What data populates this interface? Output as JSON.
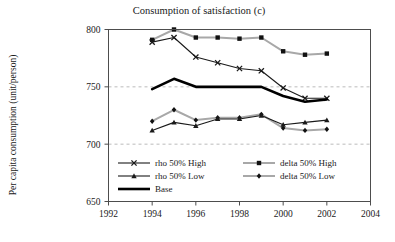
{
  "chart_data": {
    "type": "line",
    "title": "Consumption of satisfaction (c)",
    "xlabel": "",
    "ylabel": "Per capita consumption (unit/person)",
    "xlim": [
      1992,
      2004
    ],
    "ylim": [
      650,
      800
    ],
    "xticks": [
      1992,
      1994,
      1996,
      1998,
      2000,
      2002,
      2004
    ],
    "yticks": [
      650,
      700,
      750,
      800
    ],
    "grid": "horizontal-dashed",
    "legend_position": "inside-bottom-left",
    "x": [
      1994,
      1995,
      1996,
      1997,
      1998,
      1999,
      2000,
      2001,
      2002
    ],
    "series": [
      {
        "name": "rho 50% High",
        "values": [
          789,
          793,
          776,
          771,
          766,
          764,
          749,
          740,
          740
        ],
        "color": "#1a1a1a",
        "marker": "x",
        "width": 1.1
      },
      {
        "name": "rho 50% Low",
        "values": [
          712,
          719,
          716,
          722,
          722,
          725,
          717,
          719,
          721
        ],
        "color": "#1a1a1a",
        "marker": "triangle",
        "width": 1.1
      },
      {
        "name": "Base",
        "values": [
          748,
          757,
          750,
          750,
          750,
          750,
          742,
          737,
          739
        ],
        "color": "#000000",
        "marker": "none",
        "width": 2.6
      },
      {
        "name": "delta 50% High",
        "values": [
          791,
          800,
          793,
          793,
          792,
          793,
          781,
          778,
          779
        ],
        "color": "#a8a8a8",
        "marker": "square",
        "width": 2.0
      },
      {
        "name": "delta 50% Low",
        "values": [
          720,
          730,
          721,
          723,
          723,
          726,
          714,
          712,
          713
        ],
        "color": "#a8a8a8",
        "marker": "diamond",
        "width": 2.0
      }
    ],
    "legend": [
      {
        "label": "rho 50% High",
        "column": 0,
        "row": 0
      },
      {
        "label": "rho 50% Low",
        "column": 0,
        "row": 1
      },
      {
        "label": "Base",
        "column": 0,
        "row": 2
      },
      {
        "label": "delta 50% High",
        "column": 1,
        "row": 0
      },
      {
        "label": "delta 50% Low",
        "column": 1,
        "row": 1
      }
    ]
  }
}
